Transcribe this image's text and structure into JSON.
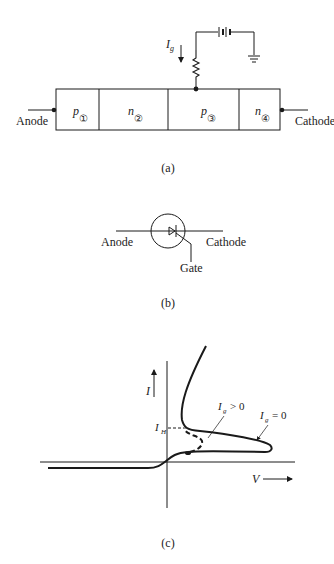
{
  "figure_a": {
    "caption": "(a)",
    "anode_label": "Anode",
    "cathode_label": "Cathode",
    "gate_current_label": "I",
    "gate_current_sub": "g",
    "regions": [
      {
        "type": "p",
        "number": "①"
      },
      {
        "type": "n",
        "number": "②"
      },
      {
        "type": "p",
        "number": "③"
      },
      {
        "type": "n",
        "number": "④"
      }
    ],
    "icons": [
      "resistor-icon",
      "battery-icon",
      "ground-icon",
      "current-arrow-icon"
    ]
  },
  "figure_b": {
    "caption": "(b)",
    "anode_label": "Anode",
    "cathode_label": "Cathode",
    "gate_label": "Gate",
    "icons": [
      "thyristor-symbol-icon"
    ]
  },
  "figure_c": {
    "caption": "(c)",
    "y_axis_label": "I",
    "x_axis_label": "V",
    "holding_current_label": "I",
    "holding_current_sub": "H",
    "curve_labels": [
      {
        "main": "I",
        "sub": "g",
        "relation": "> 0"
      },
      {
        "main": "I",
        "sub": "g",
        "relation": "= 0"
      }
    ]
  }
}
